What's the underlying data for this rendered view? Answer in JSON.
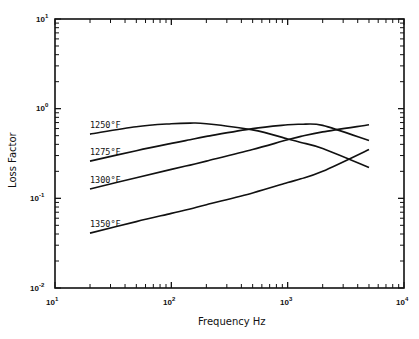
{
  "chart_data": {
    "type": "line",
    "title": "",
    "xlabel": "Frequency Hz",
    "ylabel": "Loss Factor",
    "xscale": "log",
    "yscale": "log",
    "xlim": [
      10,
      10000
    ],
    "ylim": [
      0.01,
      10
    ],
    "x_tick_labels": [
      "10^1",
      "10^2",
      "10^3",
      "10^4"
    ],
    "y_tick_labels": [
      "10^-2",
      "10^-1",
      "10^0",
      "10^1"
    ],
    "grid": false,
    "legend": "inline labels at left end of each curve",
    "x": [
      20,
      50,
      100,
      145,
      200,
      500,
      1000,
      1300,
      2000,
      5000
    ],
    "series": [
      {
        "name": "1250°F",
        "label": "1250°F",
        "values": [
          0.52,
          0.63,
          0.68,
          0.69,
          0.68,
          0.58,
          0.46,
          0.42,
          0.36,
          0.22
        ]
      },
      {
        "name": "1275°F",
        "label": "1275°F",
        "values": [
          0.26,
          0.34,
          0.41,
          0.45,
          0.49,
          0.6,
          0.66,
          0.67,
          0.65,
          0.44
        ]
      },
      {
        "name": "1300°F",
        "label": "1300°F",
        "values": [
          0.127,
          0.17,
          0.21,
          0.235,
          0.26,
          0.35,
          0.45,
          0.49,
          0.55,
          0.66
        ]
      },
      {
        "name": "1350°F",
        "label": "1350°F",
        "values": [
          0.041,
          0.055,
          0.068,
          0.076,
          0.085,
          0.115,
          0.15,
          0.165,
          0.2,
          0.35
        ]
      }
    ]
  },
  "axes": {
    "x": {
      "title": "Frequency Hz",
      "ticks": [
        {
          "base": "10",
          "exp": "1"
        },
        {
          "base": "10",
          "exp": "2"
        },
        {
          "base": "10",
          "exp": "3"
        },
        {
          "base": "10",
          "exp": "4"
        }
      ]
    },
    "y": {
      "title": "Loss Factor",
      "ticks": [
        {
          "base": "10",
          "exp": "-2"
        },
        {
          "base": "10",
          "exp": "-1"
        },
        {
          "base": "10",
          "exp": "0"
        },
        {
          "base": "10",
          "exp": "1"
        }
      ]
    }
  },
  "curve_labels": [
    "1250°F",
    "1275°F",
    "1300°F",
    "1350°F"
  ],
  "style": {
    "line_color": "#111111",
    "background": "#ffffff"
  }
}
